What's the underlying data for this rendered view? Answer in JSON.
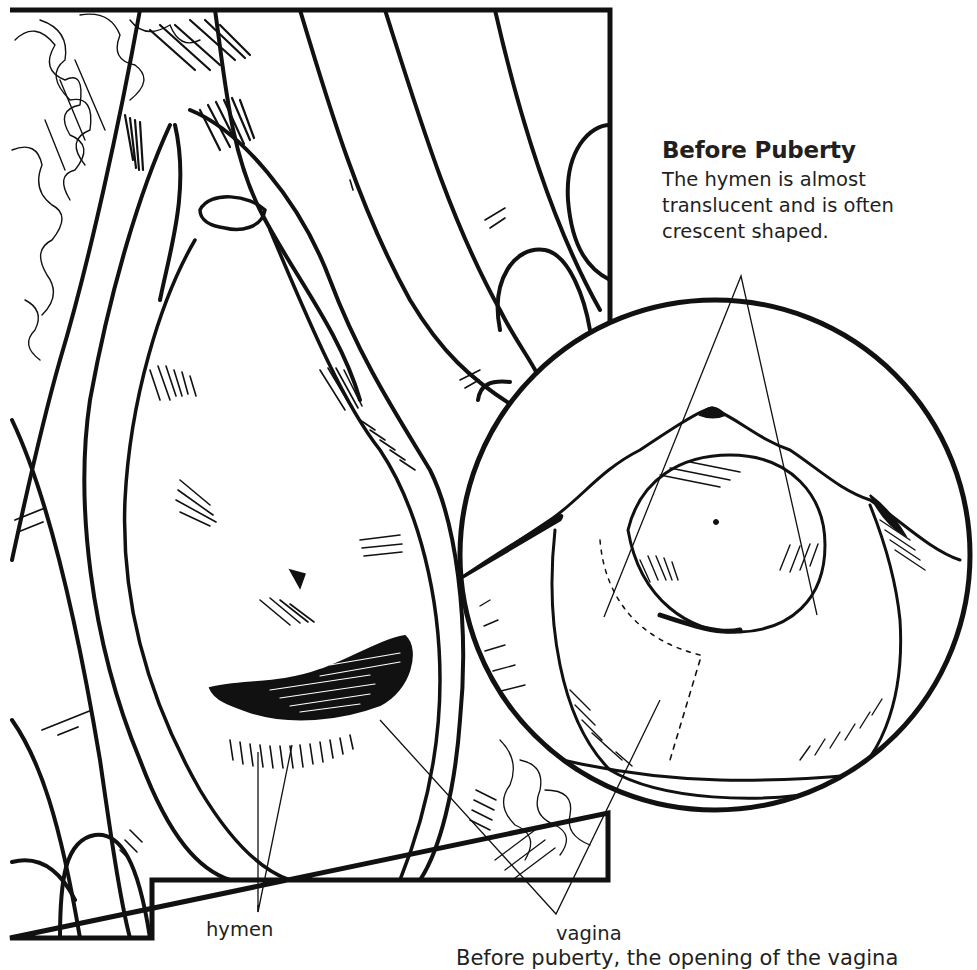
{
  "illustration": {
    "title": "Hymen and vaginal opening before puberty",
    "ink_color": "#111111",
    "paper_color": "#ffffff",
    "text_color": "#231f20"
  },
  "inset": {
    "heading": "Before Puberty",
    "description": "The hymen is almost translucent and is often crescent shaped."
  },
  "labels": {
    "hymen": "hymen",
    "vagina": "vagina"
  },
  "footer": {
    "text": "Before puberty, the opening of the vagina"
  }
}
